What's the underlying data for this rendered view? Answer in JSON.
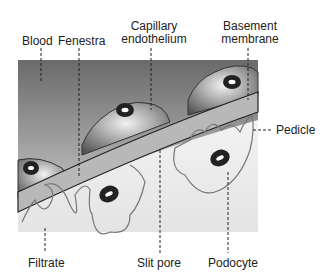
{
  "labels": {
    "blood": "Blood",
    "fenestra": "Fenestra",
    "capillary_endothelium_1": "Capillary",
    "capillary_endothelium_2": "endothelium",
    "basement_membrane_1": "Basement",
    "basement_membrane_2": "membrane",
    "pedicle": "Pedicle",
    "filtrate": "Filtrate",
    "slit_pore": "Slit pore",
    "podocyte": "Podocyte"
  }
}
